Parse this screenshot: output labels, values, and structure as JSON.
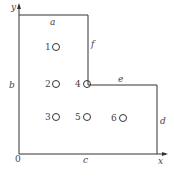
{
  "diagram": {
    "type": "L-shaped plate with holes",
    "axes": {
      "x_label": "x",
      "y_label": "y",
      "origin_label": "0"
    },
    "edge_labels": {
      "a": "a",
      "b": "b",
      "c": "c",
      "d": "d",
      "e": "e",
      "f": "f"
    },
    "points": [
      {
        "id": "1",
        "label": "1"
      },
      {
        "id": "2",
        "label": "2"
      },
      {
        "id": "3",
        "label": "3"
      },
      {
        "id": "4",
        "label": "4"
      },
      {
        "id": "5",
        "label": "5"
      },
      {
        "id": "6",
        "label": "6"
      }
    ],
    "line_color": "#333333"
  }
}
